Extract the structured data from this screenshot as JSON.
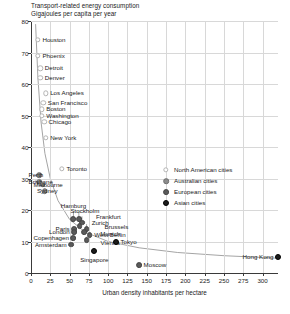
{
  "chart_data": {
    "type": "scatter",
    "title": "Transport-related energy consumption",
    "subtitle": "Gigajoules per capita per year",
    "xlabel": "Urban density inhabitants per hectare",
    "ylabel": "Gigajoules per capita per year",
    "xlim": [
      0,
      320
    ],
    "ylim": [
      0,
      80
    ],
    "xticks": [
      0,
      25,
      50,
      75,
      100,
      125,
      150,
      175,
      200,
      225,
      250,
      275,
      300
    ],
    "yticks": [
      0,
      10,
      20,
      30,
      40,
      50,
      60,
      70,
      80
    ],
    "grid": true,
    "legend_position": "center-right",
    "series": [
      {
        "name": "North American cities",
        "group": "na",
        "color": "#b4b4b4",
        "points": [
          {
            "city": "Houston",
            "x": 9,
            "y": 74,
            "label_side": "r"
          },
          {
            "city": "Phoenix",
            "x": 9,
            "y": 69,
            "label_side": "r"
          },
          {
            "city": "Detroit",
            "x": 12,
            "y": 65,
            "label_side": "r"
          },
          {
            "city": "Denver",
            "x": 12,
            "y": 62,
            "label_side": "r"
          },
          {
            "city": "Los Angeles",
            "x": 19,
            "y": 57,
            "label_side": "r"
          },
          {
            "city": "San Francisco",
            "x": 16,
            "y": 54,
            "label_side": "r"
          },
          {
            "city": "Boston",
            "x": 14,
            "y": 52,
            "label_side": "r"
          },
          {
            "city": "Washington",
            "x": 14,
            "y": 50,
            "label_side": "r"
          },
          {
            "city": "Chicago",
            "x": 17,
            "y": 48,
            "label_side": "r"
          },
          {
            "city": "New York",
            "x": 19,
            "y": 43,
            "label_side": "r"
          },
          {
            "city": "Toronto",
            "x": 40,
            "y": 33,
            "label_side": "r"
          }
        ]
      },
      {
        "name": "Australian cities",
        "group": "au",
        "color": "#8c8c8c",
        "points": [
          {
            "city": "Perth",
            "x": 11,
            "y": 31,
            "label_side": "r"
          },
          {
            "city": "Brisbane",
            "x": 11,
            "y": 29,
            "label_side": "r"
          },
          {
            "city": "Melbourne",
            "x": 15,
            "y": 28,
            "label_side": "r"
          },
          {
            "city": "Sydney",
            "x": 18,
            "y": 26,
            "label_side": "r"
          }
        ]
      },
      {
        "name": "European cities",
        "group": "eu",
        "color": "#5a5a5a",
        "points": [
          {
            "city": "Hamburg",
            "x": 55,
            "y": 17,
            "label_side": "c"
          },
          {
            "city": "Stockholm",
            "x": 62,
            "y": 17,
            "label_side": "c"
          },
          {
            "city": "Frankfurt",
            "x": 66,
            "y": 16,
            "label_side": "r"
          },
          {
            "city": "Zurich",
            "x": 63,
            "y": 15,
            "label_side": "r"
          },
          {
            "city": "Brussels",
            "x": 72,
            "y": 14,
            "label_side": "r"
          },
          {
            "city": "Munich",
            "x": 69,
            "y": 13,
            "label_side": "r"
          },
          {
            "city": "West Berlin",
            "x": 76,
            "y": 12,
            "label_side": "r"
          },
          {
            "city": "Vienna",
            "x": 72,
            "y": 10.5,
            "label_side": "r"
          },
          {
            "city": "Paris",
            "x": 56,
            "y": 14,
            "label_side": "l"
          },
          {
            "city": "London",
            "x": 56,
            "y": 13,
            "label_side": "l"
          },
          {
            "city": "Copenhagen",
            "x": 55,
            "y": 11,
            "label_side": "l"
          },
          {
            "city": "Amsterdam",
            "x": 52,
            "y": 9,
            "label_side": "l"
          },
          {
            "city": "Moscow",
            "x": 140,
            "y": 2.5,
            "label_side": "r"
          }
        ]
      },
      {
        "name": "Asian cities",
        "group": "as",
        "color": "#1c1c1c",
        "points": [
          {
            "city": "Tokyo",
            "x": 110,
            "y": 10,
            "label_side": "r"
          },
          {
            "city": "Singapore",
            "x": 82,
            "y": 7,
            "label_side": "c"
          },
          {
            "city": "Hong Kong",
            "x": 320,
            "y": 5,
            "label_side": "l"
          }
        ]
      }
    ],
    "trend_curve": {
      "description": "fitted inverse-power decay curve through all cities",
      "points": [
        {
          "x": 6,
          "y": 79
        },
        {
          "x": 9,
          "y": 62
        },
        {
          "x": 13,
          "y": 48
        },
        {
          "x": 18,
          "y": 38
        },
        {
          "x": 25,
          "y": 30
        },
        {
          "x": 35,
          "y": 23
        },
        {
          "x": 50,
          "y": 17
        },
        {
          "x": 70,
          "y": 13
        },
        {
          "x": 100,
          "y": 10
        },
        {
          "x": 140,
          "y": 8
        },
        {
          "x": 190,
          "y": 6.5
        },
        {
          "x": 250,
          "y": 5.5
        },
        {
          "x": 320,
          "y": 4.7
        }
      ]
    },
    "leader_lines": [
      {
        "from_city": "Perth",
        "to": [
          6,
          31
        ]
      },
      {
        "from_city": "Brisbane",
        "to": [
          6,
          29
        ]
      },
      {
        "from_city": "Melbourne",
        "to": [
          8,
          28
        ]
      },
      {
        "from_city": "Sydney",
        "to": [
          11,
          26.5
        ]
      },
      {
        "from_city": "Hamburg",
        "to": [
          55,
          19.5
        ]
      },
      {
        "from_city": "Stockholm",
        "to": [
          62,
          19.5
        ]
      },
      {
        "from_city": "Frankfurt",
        "to": [
          66,
          18
        ]
      },
      {
        "from_city": "Zurich",
        "to": [
          63,
          16.8
        ]
      },
      {
        "from_city": "Brussels",
        "to": [
          72,
          15.5
        ]
      },
      {
        "from_city": "Munich",
        "to": [
          69,
          14
        ]
      },
      {
        "from_city": "Vienna",
        "to": [
          72,
          11.5
        ]
      }
    ]
  },
  "legend": {
    "items": [
      {
        "label": "North American cities",
        "group": "na"
      },
      {
        "label": "Australian cities",
        "group": "au"
      },
      {
        "label": "European cities",
        "group": "eu"
      },
      {
        "label": "Asian cities",
        "group": "as"
      }
    ]
  }
}
